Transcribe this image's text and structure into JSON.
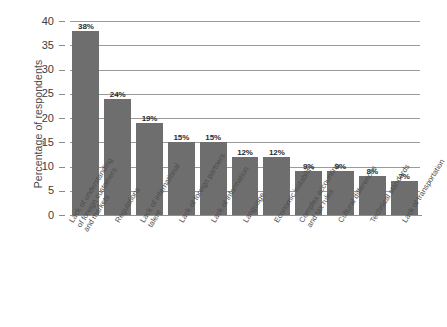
{
  "chart_data": {
    "type": "bar",
    "title": "",
    "xlabel": "",
    "ylabel": "Percentage of respondents",
    "ylim": [
      0,
      40
    ],
    "ytick_step": 5,
    "yticks": [
      0,
      5,
      10,
      15,
      20,
      25,
      30,
      35,
      40
    ],
    "grid": true,
    "legend": "none",
    "bar_color": "#6e6e6e",
    "value_suffix": "%",
    "categories": [
      "Lack of understanding of foreign customers and markets",
      "Regulations",
      "Lack of international talent",
      "Lack of foreign partners",
      "Lack of information",
      "Language",
      "Economic instability",
      "Complex accounting and tax rules",
      "Cultural differences",
      "Technical standards",
      "Lack of transportation"
    ],
    "category_lines": [
      [
        "Lack of understanding",
        "of foreign customers",
        "and markets"
      ],
      [
        "Regulations"
      ],
      [
        "Lack of international",
        "talent"
      ],
      [
        "Lack of foreign partners"
      ],
      [
        "Lack of information"
      ],
      [
        "Language"
      ],
      [
        "Economic instability"
      ],
      [
        "Complex accounting",
        "and tax rules"
      ],
      [
        "Cultural differences"
      ],
      [
        "Technical standards"
      ],
      [
        "Lack of transportation"
      ]
    ],
    "values": [
      38,
      24,
      19,
      15,
      15,
      12,
      12,
      9,
      9,
      8,
      7
    ],
    "value_labels": [
      "38%",
      "24%",
      "19%",
      "15%",
      "15%",
      "12%",
      "12%",
      "9%",
      "9%",
      "8%",
      "7%"
    ]
  }
}
